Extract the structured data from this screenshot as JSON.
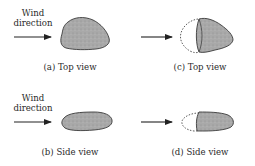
{
  "figure": {
    "panels": [
      {
        "id": "a",
        "caption": "(a) Top view",
        "wind_label_line1": "Wind",
        "wind_label_line2": "direction",
        "view": "top",
        "state": "original"
      },
      {
        "id": "b",
        "caption": "(b) Side view",
        "wind_label_line1": "Wind",
        "wind_label_line2": "direction",
        "view": "side",
        "state": "original"
      },
      {
        "id": "c",
        "caption": "(c) Top view",
        "view": "top",
        "state": "eroded"
      },
      {
        "id": "d",
        "caption": "(d) Side view",
        "view": "side",
        "state": "eroded"
      }
    ],
    "colors": {
      "stone_fill": "#a8a8a8",
      "stone_outline": "#3a3a3a",
      "text": "#2a2a2a",
      "background": "#ffffff"
    }
  }
}
